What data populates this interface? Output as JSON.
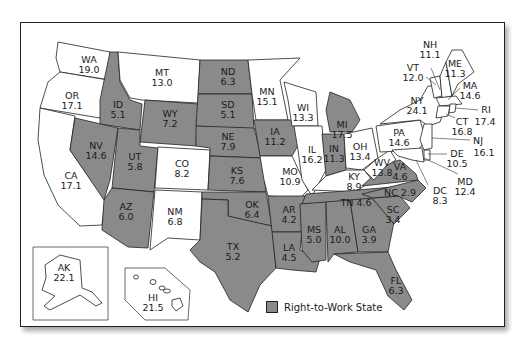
{
  "legend": {
    "label": "Right-to-Work State",
    "swatch_color": "#8a8a8a"
  },
  "colors": {
    "rtw": "#8a8a8a",
    "non_rtw": "#ffffff",
    "border": "#222222"
  },
  "states": [
    {
      "abbr": "WA",
      "value": "19.0",
      "rtw": false
    },
    {
      "abbr": "OR",
      "value": "17.1",
      "rtw": false
    },
    {
      "abbr": "CA",
      "value": "17.1",
      "rtw": false
    },
    {
      "abbr": "ID",
      "value": "5.1",
      "rtw": true
    },
    {
      "abbr": "NV",
      "value": "14.6",
      "rtw": true
    },
    {
      "abbr": "MT",
      "value": "13.0",
      "rtw": false
    },
    {
      "abbr": "WY",
      "value": "7.2",
      "rtw": true
    },
    {
      "abbr": "UT",
      "value": "5.8",
      "rtw": true
    },
    {
      "abbr": "AZ",
      "value": "6.0",
      "rtw": true
    },
    {
      "abbr": "CO",
      "value": "8.2",
      "rtw": false
    },
    {
      "abbr": "NM",
      "value": "6.8",
      "rtw": false
    },
    {
      "abbr": "ND",
      "value": "6.3",
      "rtw": true
    },
    {
      "abbr": "SD",
      "value": "5.1",
      "rtw": true
    },
    {
      "abbr": "NE",
      "value": "7.9",
      "rtw": true
    },
    {
      "abbr": "KS",
      "value": "7.6",
      "rtw": true
    },
    {
      "abbr": "OK",
      "value": "6.4",
      "rtw": true
    },
    {
      "abbr": "TX",
      "value": "5.2",
      "rtw": true
    },
    {
      "abbr": "MN",
      "value": "15.1",
      "rtw": false
    },
    {
      "abbr": "IA",
      "value": "11.2",
      "rtw": true
    },
    {
      "abbr": "MO",
      "value": "10.9",
      "rtw": false
    },
    {
      "abbr": "AR",
      "value": "4.2",
      "rtw": true
    },
    {
      "abbr": "LA",
      "value": "4.5",
      "rtw": true
    },
    {
      "abbr": "WI",
      "value": "13.3",
      "rtw": false
    },
    {
      "abbr": "IL",
      "value": "16.2",
      "rtw": false
    },
    {
      "abbr": "MI",
      "value": "17.5",
      "rtw": true
    },
    {
      "abbr": "IN",
      "value": "11.3",
      "rtw": true
    },
    {
      "abbr": "OH",
      "value": "13.4",
      "rtw": false
    },
    {
      "abbr": "KY",
      "value": "8.9",
      "rtw": false
    },
    {
      "abbr": "TN",
      "value": "4.6",
      "rtw": true
    },
    {
      "abbr": "MS",
      "value": "5.0",
      "rtw": true
    },
    {
      "abbr": "AL",
      "value": "10.0",
      "rtw": true
    },
    {
      "abbr": "GA",
      "value": "3.9",
      "rtw": true
    },
    {
      "abbr": "FL",
      "value": "6.3",
      "rtw": true
    },
    {
      "abbr": "SC",
      "value": "3.4",
      "rtw": true
    },
    {
      "abbr": "NC",
      "value": "2.9",
      "rtw": true
    },
    {
      "abbr": "VA",
      "value": "4.6",
      "rtw": true
    },
    {
      "abbr": "WV",
      "value": "13.8",
      "rtw": false
    },
    {
      "abbr": "PA",
      "value": "14.6",
      "rtw": false
    },
    {
      "abbr": "NY",
      "value": "24.1",
      "rtw": false
    },
    {
      "abbr": "VT",
      "value": "12.0",
      "rtw": false
    },
    {
      "abbr": "NH",
      "value": "11.1",
      "rtw": false
    },
    {
      "abbr": "ME",
      "value": "11.3",
      "rtw": false
    },
    {
      "abbr": "MA",
      "value": "14.6",
      "rtw": false
    },
    {
      "abbr": "RI",
      "value": "17.4",
      "rtw": false
    },
    {
      "abbr": "CT",
      "value": "16.8",
      "rtw": false
    },
    {
      "abbr": "NJ",
      "value": "16.1",
      "rtw": false
    },
    {
      "abbr": "DE",
      "value": "10.5",
      "rtw": false
    },
    {
      "abbr": "MD",
      "value": "12.4",
      "rtw": false
    },
    {
      "abbr": "DC",
      "value": "8.3",
      "rtw": false
    },
    {
      "abbr": "AK",
      "value": "22.1",
      "rtw": false
    },
    {
      "abbr": "HI",
      "value": "21.5",
      "rtw": false
    }
  ],
  "labels": {
    "WA": {
      "abbr": "WA",
      "value": "19.0"
    },
    "OR": {
      "abbr": "OR",
      "value": "17.1"
    },
    "CA": {
      "abbr": "CA",
      "value": "17.1"
    },
    "ID": {
      "abbr": "ID",
      "value": "5.1"
    },
    "NV": {
      "abbr": "NV",
      "value": "14.6"
    },
    "MT": {
      "abbr": "MT",
      "value": "13.0"
    },
    "WY": {
      "abbr": "WY",
      "value": "7.2"
    },
    "UT": {
      "abbr": "UT",
      "value": "5.8"
    },
    "AZ": {
      "abbr": "AZ",
      "value": "6.0"
    },
    "CO": {
      "abbr": "CO",
      "value": "8.2"
    },
    "NM": {
      "abbr": "NM",
      "value": "6.8"
    },
    "ND": {
      "abbr": "ND",
      "value": "6.3"
    },
    "SD": {
      "abbr": "SD",
      "value": "5.1"
    },
    "NE": {
      "abbr": "NE",
      "value": "7.9"
    },
    "KS": {
      "abbr": "KS",
      "value": "7.6"
    },
    "OK": {
      "abbr": "OK",
      "value": "6.4"
    },
    "TX": {
      "abbr": "TX",
      "value": "5.2"
    },
    "MN": {
      "abbr": "MN",
      "value": "15.1"
    },
    "IA": {
      "abbr": "IA",
      "value": "11.2"
    },
    "MO": {
      "abbr": "MO",
      "value": "10.9"
    },
    "AR": {
      "abbr": "AR",
      "value": "4.2"
    },
    "LA": {
      "abbr": "LA",
      "value": "4.5"
    },
    "WI": {
      "abbr": "WI",
      "value": "13.3"
    },
    "IL": {
      "abbr": "IL",
      "value": "16.2"
    },
    "MI": {
      "abbr": "MI",
      "value": "17.5"
    },
    "IN": {
      "abbr": "IN",
      "value": "11.3"
    },
    "OH": {
      "abbr": "OH",
      "value": "13.4"
    },
    "KY": {
      "abbr": "KY",
      "value": "8.9"
    },
    "TN": {
      "abbr": "TN",
      "value": "TN 4.6"
    },
    "MS": {
      "abbr": "MS",
      "value": "5.0"
    },
    "AL": {
      "abbr": "AL",
      "value": "10.0"
    },
    "GA": {
      "abbr": "GA",
      "value": "3.9"
    },
    "FL": {
      "abbr": "FL",
      "value": "6.3"
    },
    "SC": {
      "abbr": "SC",
      "value": "3.4"
    },
    "NC": {
      "abbr": "NC",
      "value": "NC 2.9"
    },
    "VA": {
      "abbr": "VA",
      "value": "4.6"
    },
    "WV": {
      "abbr": "WV",
      "value": "13.8"
    },
    "PA": {
      "abbr": "PA",
      "value": "14.6"
    },
    "NY": {
      "abbr": "NY",
      "value": "24.1"
    },
    "VT": {
      "abbr": "VT",
      "value": "12.0"
    },
    "NH": {
      "abbr": "NH",
      "value": "11.1"
    },
    "ME": {
      "abbr": "ME",
      "value": "11.3"
    },
    "MA": {
      "abbr": "MA",
      "value": "14.6"
    },
    "RI": {
      "abbr": "RI",
      "value": "17.4"
    },
    "CT": {
      "abbr": "CT",
      "value": "16.8"
    },
    "NJ": {
      "abbr": "NJ",
      "value": "16.1"
    },
    "DE": {
      "abbr": "DE",
      "value": "10.5"
    },
    "MD": {
      "abbr": "MD",
      "value": "12.4"
    },
    "DC": {
      "abbr": "DC",
      "value": "8.3"
    },
    "AK": {
      "abbr": "AK",
      "value": "22.1"
    },
    "HI": {
      "abbr": "HI",
      "value": "21.5"
    }
  }
}
